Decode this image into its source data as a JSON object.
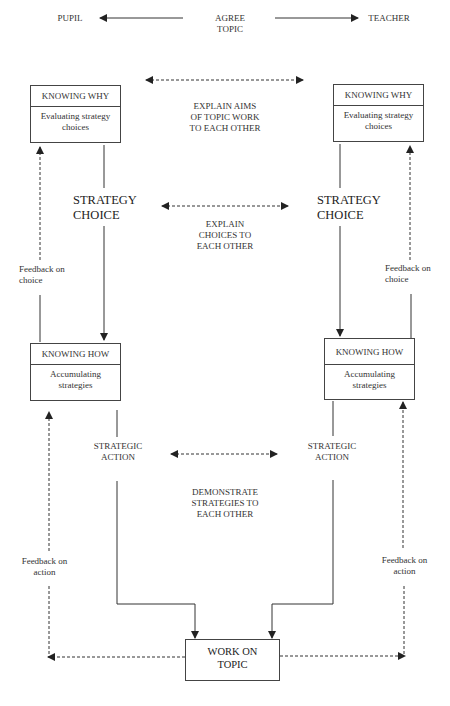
{
  "header": {
    "left_label": "PUPIL",
    "center_label": "AGREE\nTOPIC",
    "right_label": "TEACHER"
  },
  "left_column": {
    "knowing_why": {
      "title": "KNOWING WHY",
      "body": "Evaluating strategy\nchoices"
    },
    "strategy_choice": "STRATEGY\nCHOICE",
    "feedback_choice": "Feedback on\nchoice",
    "knowing_how": {
      "title": "KNOWING HOW",
      "body": "Accumulating\nstrategies"
    },
    "strategic_action": "STRATEGIC\nACTION",
    "feedback_action": "Feedback on\naction"
  },
  "right_column": {
    "knowing_why": {
      "title": "KNOWING WHY",
      "body": "Evaluating strategy\nchoices"
    },
    "strategy_choice": "STRATEGY\nCHOICE",
    "feedback_choice": "Feedback on\nchoice",
    "knowing_how": {
      "title": "KNOWING HOW",
      "body": "Accumulating\nstrategies"
    },
    "strategic_action": "STRATEGIC\nACTION",
    "feedback_action": "Feedback on\naction"
  },
  "center": {
    "explain_aims": "EXPLAIN AIMS\nOF TOPIC WORK\nTO EACH OTHER",
    "explain_choices": "EXPLAIN\nCHOICES TO\nEACH OTHER",
    "demonstrate": "DEMONSTRATE\nSTRATEGIES TO\nEACH OTHER"
  },
  "bottom": {
    "work_on_topic": "WORK ON\nTOPIC"
  },
  "colors": {
    "line": "#333333",
    "box_border": "#444444",
    "background": "#ffffff"
  }
}
